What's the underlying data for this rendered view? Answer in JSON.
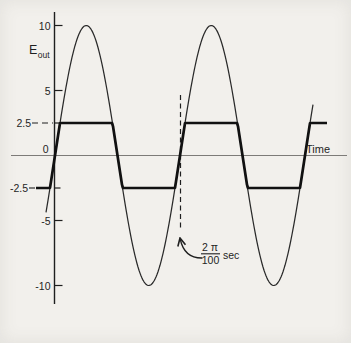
{
  "figure": {
    "kind": "clipper-circuit-waveform-figure"
  },
  "colors": {
    "background": "#f2f0ec",
    "ink": "#1f1f1f",
    "sine": "#2a2a2a",
    "clipped": "#111111",
    "x_axis": "#7d7b78"
  },
  "chart_data": {
    "type": "line",
    "title": "",
    "ylabel_main": "E",
    "ylabel_sub": "out",
    "xlabel": "Time",
    "y_axis": {
      "range": [
        -11.5,
        11.5
      ],
      "ticks": [
        {
          "value": 10,
          "label": "10"
        },
        {
          "value": 5,
          "label": "5"
        },
        {
          "value": 2.5,
          "label": "2.5"
        },
        {
          "value": 0,
          "label": "0"
        },
        {
          "value": -2.5,
          "label": "-2.5"
        },
        {
          "value": -5,
          "label": "-5"
        },
        {
          "value": -10,
          "label": "-10"
        }
      ]
    },
    "grid": false,
    "legend": false,
    "series": [
      {
        "name": "sine-input",
        "type": "sine",
        "amplitude": 10,
        "peak_value": 10,
        "trough_value": -10,
        "cycles_visible": 2.1
      },
      {
        "name": "clipped-output",
        "type": "clipped-sine",
        "amplitude": 10,
        "clip_level_positive": 2.5,
        "clip_level_negative": -2.5
      }
    ],
    "period_annotation": {
      "numerator": "2 π",
      "denominator": "100",
      "unit": "sec",
      "marks": "one full period after first positive-going zero crossing"
    }
  }
}
